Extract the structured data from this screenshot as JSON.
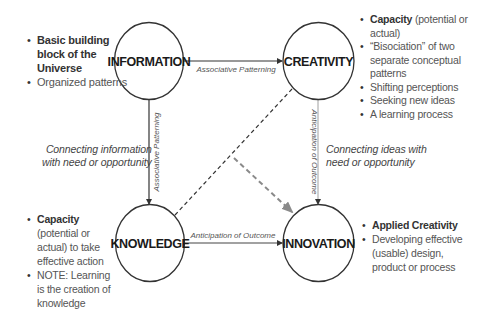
{
  "nodes": {
    "information": "INFORMATION",
    "creativity": "CREATIVITY",
    "knowledge": "KNOWLEDGE",
    "innovation": "INNOVATION"
  },
  "edges": {
    "info_to_creativity": "Associative Patterning",
    "info_to_knowledge": "Associative Patterning",
    "creativity_to_innovation": "Anticipation of Outcome",
    "knowledge_to_innovation": "Anticipation of Outcome"
  },
  "connect_notes": {
    "left": [
      "Connecting information",
      "with need or opportunity"
    ],
    "right": [
      "Connecting ideas with",
      "need or opportunity"
    ]
  },
  "information_bullets": [
    {
      "bold": "Basic building block of the Universe",
      "text": ""
    },
    {
      "bold": "",
      "text": "Organized patterns"
    }
  ],
  "creativity_bullets": [
    {
      "bold": "Capacity",
      "text": " (potential or actual)"
    },
    {
      "bold": "",
      "text": "“Bisociation” of two separate conceptual patterns"
    },
    {
      "bold": "",
      "text": "Shifting perceptions"
    },
    {
      "bold": "",
      "text": "Seeking new ideas"
    },
    {
      "bold": "",
      "text": "A learning process"
    }
  ],
  "knowledge_bullets": [
    {
      "bold": "Capacity",
      "text": " (potential or actual) to take effective action"
    },
    {
      "bold": "",
      "text": "NOTE: Learning is the creation of knowledge"
    }
  ],
  "innovation_bullets": [
    {
      "bold": "Applied Creativity",
      "text": ""
    },
    {
      "bold": "",
      "text": "Developing effective (usable) design, product or process"
    }
  ],
  "colors": {
    "line": "#333333",
    "dashed_gray": "#888888"
  }
}
